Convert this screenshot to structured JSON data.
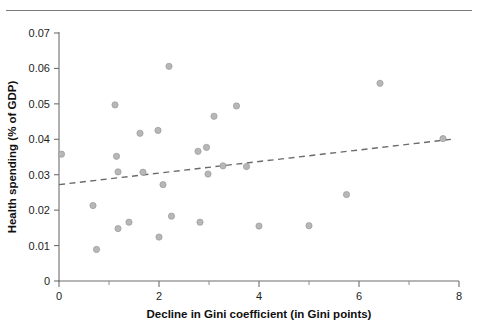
{
  "figure": {
    "top_rule": "horizontal-rule",
    "background_color": "#ffffff"
  },
  "chart_data": {
    "type": "scatter",
    "title": "",
    "xlabel": "Decline in Gini coefficient (in Gini points)",
    "ylabel": "Health spending (% of GDP)",
    "xlim": [
      0,
      8
    ],
    "ylim": [
      0,
      0.07
    ],
    "xticks": [
      0,
      2,
      4,
      6,
      8
    ],
    "xtick_labels": [
      "0",
      "2",
      "4",
      "6",
      "8"
    ],
    "xminor_ticks": [
      1,
      3,
      5,
      7
    ],
    "yticks": [
      0,
      0.01,
      0.02,
      0.03,
      0.04,
      0.05,
      0.06,
      0.07
    ],
    "ytick_labels": [
      "0",
      "0.01",
      "0.02",
      "0.03",
      "0.04",
      "0.05",
      "0.06",
      "0.07"
    ],
    "grid": false,
    "legend": false,
    "marker_color": "#b7b7b7",
    "marker_edge_color": "#9a9a9a",
    "marker_size": 5,
    "points": [
      {
        "x": 0.05,
        "y": 0.0358
      },
      {
        "x": 0.68,
        "y": 0.0213
      },
      {
        "x": 0.75,
        "y": 0.0089
      },
      {
        "x": 1.12,
        "y": 0.0497
      },
      {
        "x": 1.15,
        "y": 0.0352
      },
      {
        "x": 1.18,
        "y": 0.0308
      },
      {
        "x": 1.18,
        "y": 0.0148
      },
      {
        "x": 1.4,
        "y": 0.0166
      },
      {
        "x": 1.62,
        "y": 0.0417
      },
      {
        "x": 1.68,
        "y": 0.0307
      },
      {
        "x": 1.98,
        "y": 0.0425
      },
      {
        "x": 2.0,
        "y": 0.0124
      },
      {
        "x": 2.08,
        "y": 0.0272
      },
      {
        "x": 2.2,
        "y": 0.0606
      },
      {
        "x": 2.25,
        "y": 0.0183
      },
      {
        "x": 2.78,
        "y": 0.0366
      },
      {
        "x": 2.82,
        "y": 0.0166
      },
      {
        "x": 2.95,
        "y": 0.0377
      },
      {
        "x": 2.98,
        "y": 0.0302
      },
      {
        "x": 3.1,
        "y": 0.0465
      },
      {
        "x": 3.28,
        "y": 0.0325
      },
      {
        "x": 3.55,
        "y": 0.0494
      },
      {
        "x": 3.75,
        "y": 0.0323
      },
      {
        "x": 4.0,
        "y": 0.0155
      },
      {
        "x": 5.0,
        "y": 0.0156
      },
      {
        "x": 5.75,
        "y": 0.0244
      },
      {
        "x": 6.42,
        "y": 0.0558
      },
      {
        "x": 7.68,
        "y": 0.0402
      }
    ],
    "trendline": {
      "style": "dashed",
      "color": "#6b6b6b",
      "x_start": 0.0,
      "y_start": 0.0272,
      "x_end": 7.85,
      "y_end": 0.04
    }
  }
}
